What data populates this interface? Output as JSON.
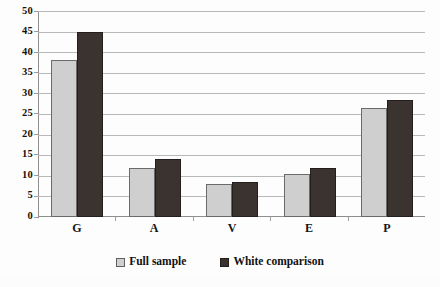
{
  "chart_data": {
    "type": "bar",
    "title": "",
    "subtitle": "",
    "xlabel": "",
    "ylabel": "",
    "categories": [
      "G",
      "A",
      "V",
      "E",
      "P"
    ],
    "series": [
      {
        "name": "Full sample",
        "color": "#cfcfcf",
        "values": [
          38,
          12,
          8,
          10.5,
          26.5
        ]
      },
      {
        "name": "White comparison",
        "color": "#3a3330",
        "values": [
          45,
          14,
          8.5,
          12,
          28.3
        ]
      }
    ],
    "ylim": [
      0,
      50
    ],
    "y_tick_step": 5,
    "y_ticks": [
      0,
      5,
      10,
      15,
      20,
      25,
      30,
      35,
      40,
      45,
      50
    ],
    "y_tick_labels": [
      "0",
      "5",
      "10",
      "15",
      "20",
      "25",
      "30",
      "35",
      "40",
      "45",
      "50"
    ],
    "grid": true,
    "grid_axis": "y",
    "legend_position": "bottom",
    "legend": [
      "Full sample",
      "White comparison"
    ]
  }
}
